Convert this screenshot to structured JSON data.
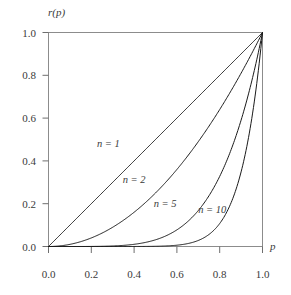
{
  "chart_data": {
    "type": "line",
    "title": "",
    "subtitle": "",
    "xlabel": "p",
    "ylabel": "r(p)",
    "xlim": [
      0.0,
      1.0
    ],
    "ylim": [
      0.0,
      1.0
    ],
    "grid": false,
    "legend_position": "inline-annotations",
    "xticks": [
      "0.0",
      "0.2",
      "0.4",
      "0.6",
      "0.8",
      "1.0"
    ],
    "xtick_values": [
      0.0,
      0.2,
      0.4,
      0.6,
      0.8,
      1.0
    ],
    "yticks": [
      "0.0",
      "0.2",
      "0.4",
      "0.6",
      "0.8",
      "1.0"
    ],
    "ytick_values": [
      0.0,
      0.2,
      0.4,
      0.6,
      0.8,
      1.0
    ],
    "x": [
      0.0,
      0.05,
      0.1,
      0.15,
      0.2,
      0.25,
      0.3,
      0.35,
      0.4,
      0.45,
      0.5,
      0.55,
      0.6,
      0.65,
      0.7,
      0.75,
      0.8,
      0.85,
      0.9,
      0.95,
      1.0
    ],
    "series": [
      {
        "name": "n = 1",
        "exponent": 1,
        "values": [
          0.0,
          0.05,
          0.1,
          0.15,
          0.2,
          0.25,
          0.3,
          0.35,
          0.4,
          0.45,
          0.5,
          0.55,
          0.6,
          0.65,
          0.7,
          0.75,
          0.8,
          0.85,
          0.9,
          0.95,
          1.0
        ],
        "color": "#1a1a1a"
      },
      {
        "name": "n = 2",
        "exponent": 2,
        "values": [
          0.0,
          0.0025,
          0.01,
          0.0225,
          0.04,
          0.0625,
          0.09,
          0.1225,
          0.16,
          0.2025,
          0.25,
          0.3025,
          0.36,
          0.4225,
          0.49,
          0.5625,
          0.64,
          0.7225,
          0.81,
          0.9025,
          1.0
        ],
        "color": "#1a1a1a"
      },
      {
        "name": "n = 5",
        "exponent": 5,
        "values": [
          0.0,
          3e-07,
          1e-05,
          7.59e-05,
          0.00032,
          0.000977,
          0.00243,
          0.00525,
          0.01024,
          0.01845,
          0.03125,
          0.05033,
          0.07776,
          0.11603,
          0.16807,
          0.2373,
          0.32768,
          0.44371,
          0.59049,
          0.77378,
          1.0
        ],
        "color": "#1a1a1a"
      },
      {
        "name": "n = 10",
        "exponent": 10,
        "values": [
          0.0,
          0.0,
          0.0,
          0.0,
          1e-07,
          1e-06,
          5.9e-06,
          2.76e-05,
          0.0001049,
          0.00034,
          0.000977,
          0.00253,
          0.00605,
          0.01346,
          0.02825,
          0.05631,
          0.10737,
          0.19687,
          0.34868,
          0.59874,
          1.0
        ],
        "color": "#1a1a1a"
      }
    ],
    "annotations": [
      {
        "text": "n = 1",
        "x": 0.28,
        "y": 0.465
      },
      {
        "text": "n = 2",
        "x": 0.4,
        "y": 0.295
      },
      {
        "text": "n = 5",
        "x": 0.545,
        "y": 0.185
      },
      {
        "text": "n = 10",
        "x": 0.765,
        "y": 0.155
      }
    ]
  }
}
